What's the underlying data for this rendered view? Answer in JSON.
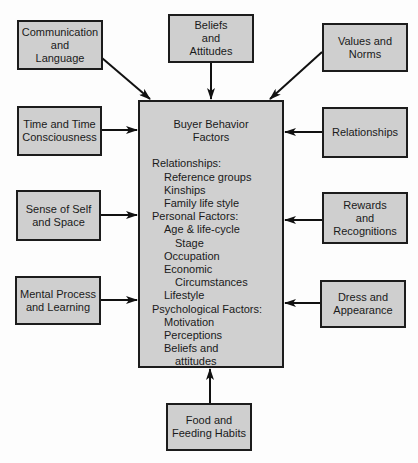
{
  "diagram": {
    "central": {
      "title": "Buyer Behavior\nFactors",
      "lines": [
        {
          "level": 0,
          "text": "Relationships:"
        },
        {
          "level": 1,
          "text": "Reference groups"
        },
        {
          "level": 1,
          "text": "Kinships"
        },
        {
          "level": 1,
          "text": "Family life style"
        },
        {
          "level": 0,
          "text": "Personal Factors:"
        },
        {
          "level": 1,
          "text": "Age & life-cycle"
        },
        {
          "level": 2,
          "text": "Stage"
        },
        {
          "level": 1,
          "text": "Occupation"
        },
        {
          "level": 1,
          "text": "Economic"
        },
        {
          "level": 2,
          "text": "Circumstances"
        },
        {
          "level": 1,
          "text": "Lifestyle"
        },
        {
          "level": 0,
          "text": "Psychological Factors:"
        },
        {
          "level": 1,
          "text": "Motivation"
        },
        {
          "level": 1,
          "text": "Perceptions"
        },
        {
          "level": 1,
          "text": "Beliefs and"
        },
        {
          "level": 2,
          "text": "attitudes"
        }
      ]
    },
    "nodes": {
      "communication": "Communication\nand\nLanguage",
      "beliefs": "Beliefs\nand\nAttitudes",
      "values": "Values and\nNorms",
      "time": "Time and Time\nConsciousness",
      "relationships": "Relationships",
      "sense": "Sense of Self\nand Space",
      "rewards": "Rewards\nand\nRecognitions",
      "mental": "Mental Process\nand Learning",
      "dress": "Dress and\nAppearance",
      "food": "Food and\nFeeding Habits"
    },
    "edges": [
      {
        "from": "communication",
        "to": "central"
      },
      {
        "from": "beliefs",
        "to": "central"
      },
      {
        "from": "values",
        "to": "central"
      },
      {
        "from": "time",
        "to": "central"
      },
      {
        "from": "relationships",
        "to": "central"
      },
      {
        "from": "sense",
        "to": "central"
      },
      {
        "from": "rewards",
        "to": "central"
      },
      {
        "from": "mental",
        "to": "central"
      },
      {
        "from": "dress",
        "to": "central"
      },
      {
        "from": "food",
        "to": "central"
      }
    ]
  }
}
